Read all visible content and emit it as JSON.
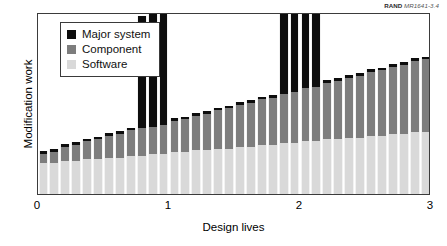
{
  "credit": {
    "brand": "RAND",
    "code": "MR1641-3.4"
  },
  "axes": {
    "y_title": "Modification work",
    "x_title": "Design lives",
    "x_ticks": [
      "0",
      "1",
      "2",
      "3"
    ]
  },
  "legend": {
    "items": [
      {
        "label": "Major system",
        "color": "#0d0d0d",
        "key": "major"
      },
      {
        "label": "Component",
        "color": "#7d7d7d",
        "key": "component"
      },
      {
        "label": "Software",
        "color": "#d9d9d9",
        "key": "software"
      }
    ]
  },
  "chart_data": {
    "type": "bar",
    "subtype": "stacked",
    "title": "",
    "xlabel": "Design lives",
    "ylabel": "Modification work",
    "xlim": [
      0,
      3
    ],
    "ylim": [
      0,
      100
    ],
    "grid": false,
    "legend_position": "top-left",
    "x_tick_values": [
      0,
      1,
      2,
      3
    ],
    "y_tick_values": [],
    "note": "Stacked bars: Software (bottom, light gray) + Component (middle, medium gray) + Major system (top, black). Major-system segment is a thin cap on most bars, but spikes tall at design-life boundaries 1 and 2.",
    "x": [
      0.042,
      0.125,
      0.208,
      0.292,
      0.375,
      0.458,
      0.542,
      0.625,
      0.708,
      0.792,
      0.875,
      0.958,
      1.042,
      1.125,
      1.208,
      1.292,
      1.375,
      1.458,
      1.542,
      1.625,
      1.708,
      1.792,
      1.875,
      1.958,
      2.042,
      2.125,
      2.208,
      2.292,
      2.375,
      2.458,
      2.542,
      2.625,
      2.708,
      2.792,
      2.875,
      2.958
    ],
    "series": [
      {
        "name": "Software",
        "color": "#d9d9d9",
        "values": [
          17,
          17,
          18,
          18,
          19,
          19,
          20,
          20,
          21,
          21,
          22,
          22,
          23,
          23,
          24,
          24,
          25,
          25,
          26,
          26,
          27,
          27,
          28,
          28,
          29,
          29,
          30,
          30,
          31,
          31,
          32,
          32,
          33,
          33,
          34,
          34
        ]
      },
      {
        "name": "Component",
        "color": "#7d7d7d",
        "values": [
          5,
          6,
          8,
          9,
          10,
          11,
          12,
          13,
          14,
          15,
          15,
          16,
          17,
          18,
          19,
          20,
          21,
          22,
          23,
          24,
          25,
          26,
          27,
          28,
          29,
          30,
          31,
          32,
          33,
          34,
          35,
          36,
          37,
          38,
          39,
          40
        ]
      },
      {
        "name": "Major system",
        "color": "#0d0d0d",
        "values": [
          1.5,
          1.5,
          1.5,
          1.5,
          1.5,
          1.5,
          1.5,
          1.5,
          1.5,
          62,
          63,
          64,
          1.5,
          1.5,
          1.5,
          1.5,
          1.5,
          1.5,
          1.5,
          1.5,
          1.5,
          1.5,
          81,
          82,
          83,
          84,
          1.5,
          1.5,
          1.5,
          1.5,
          1.5,
          1.5,
          1.5,
          1.5,
          1.5,
          1.5
        ]
      }
    ]
  }
}
